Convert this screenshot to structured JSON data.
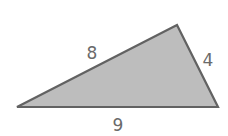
{
  "diagram": {
    "shape": "triangle",
    "fill_color": "#bdbdbd",
    "stroke_color": "#626262",
    "label_color": "#6a6a6a",
    "vertices": {
      "top": [
        177,
        25
      ],
      "left": [
        17,
        107
      ],
      "right": [
        218,
        107
      ]
    },
    "sides": [
      {
        "name": "left-side",
        "label": "8",
        "x": 92,
        "y": 59
      },
      {
        "name": "right-side",
        "label": "4",
        "x": 208,
        "y": 66
      },
      {
        "name": "bottom-side",
        "label": "9",
        "x": 118,
        "y": 131
      }
    ]
  }
}
